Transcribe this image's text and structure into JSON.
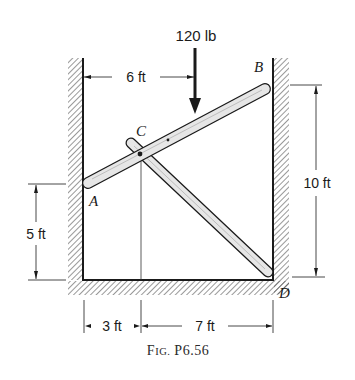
{
  "figure": {
    "caption": "Fig. P6.56",
    "caption_small_caps": {
      "F": "F",
      "ig": "IG.",
      "rest": " P6.56"
    }
  },
  "load": {
    "label": "120 lb"
  },
  "points": {
    "A": "A",
    "B": "B",
    "C": "C",
    "D": "D"
  },
  "dimensions": {
    "horizontal_top": "6 ft",
    "vertical_right": "10 ft",
    "vertical_left": "5 ft",
    "bottom_left": "3 ft",
    "bottom_right": "7 ft"
  },
  "colors": {
    "ink": "#1a1a1a",
    "bar_fill": "#e6e6e6",
    "hatch": "#444444"
  }
}
